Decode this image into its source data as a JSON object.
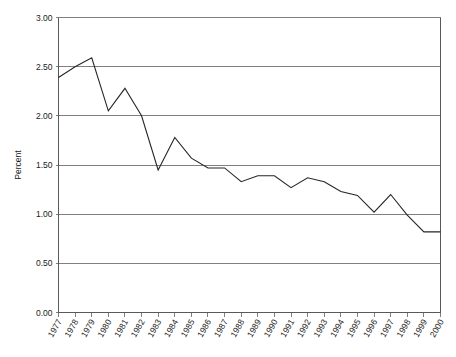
{
  "chart_data": {
    "type": "line",
    "title": "",
    "xlabel": "",
    "ylabel": "Percent",
    "ylim": [
      0.0,
      3.0
    ],
    "y_ticks": [
      "0.00",
      "0.50",
      "1.00",
      "1.50",
      "2.00",
      "2.50",
      "3.00"
    ],
    "y_tick_values": [
      0.0,
      0.5,
      1.0,
      1.5,
      2.0,
      2.5,
      3.0
    ],
    "grid": true,
    "legend": "none",
    "categories": [
      "1977",
      "1978",
      "1979",
      "1980",
      "1981",
      "1982",
      "1983",
      "1984",
      "1985",
      "1986",
      "1987",
      "1988",
      "1989",
      "1990",
      "1991",
      "1992",
      "1993",
      "1994",
      "1995",
      "1996",
      "1997",
      "1998",
      "1999",
      "2000"
    ],
    "values": [
      2.39,
      2.5,
      2.59,
      2.05,
      2.28,
      2.0,
      1.45,
      1.78,
      1.57,
      1.47,
      1.47,
      1.33,
      1.39,
      1.39,
      1.27,
      1.37,
      1.33,
      1.23,
      1.19,
      1.02,
      1.2,
      0.99,
      0.82,
      0.82
    ],
    "series": [
      {
        "name": "Percent",
        "values": [
          2.39,
          2.5,
          2.59,
          2.05,
          2.28,
          2.0,
          1.45,
          1.78,
          1.57,
          1.47,
          1.47,
          1.33,
          1.39,
          1.39,
          1.27,
          1.37,
          1.33,
          1.23,
          1.19,
          1.02,
          1.2,
          0.99,
          0.82,
          0.82
        ],
        "color": "#262626"
      }
    ],
    "colors": {
      "line": "#262626",
      "grid": "#808080",
      "axis": "#595959",
      "background": "#ffffff",
      "text": "#1a1a1a"
    }
  }
}
